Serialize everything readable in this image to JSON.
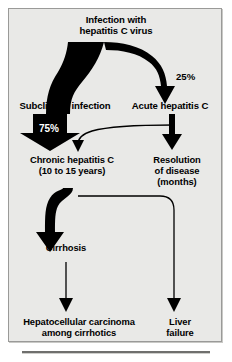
{
  "figure": {
    "background_color": "#e9e9e7",
    "border_color": "#9a9a98",
    "ink_color": "#000000"
  },
  "nodes": {
    "infection": "Infection with\nhepatitis C virus",
    "subclinical": "Subclinical infection",
    "acute": "Acute hepatitis C",
    "chronic": "Chronic hepatitis C\n(10 to 15 years)",
    "resolution": "Resolution\nof disease\n(months)",
    "cirrhosis": "Cirrhosis",
    "hcc": "Hepatocellular carcinoma\namong cirrhotics",
    "liver_failure": "Liver\nfailure"
  },
  "labels": {
    "subclinical_pct": "75%",
    "acute_pct": "25%"
  },
  "flow": [
    {
      "from": "infection",
      "to": "subclinical",
      "style": "thick-black-band",
      "label": "75%"
    },
    {
      "from": "infection",
      "to": "acute",
      "style": "thick-curved-arrow",
      "label": "25%"
    },
    {
      "from": "acute",
      "to": "resolution",
      "style": "thick-arrow",
      "label": ""
    },
    {
      "from": "acute",
      "to": "chronic",
      "style": "thin-curved-arrow",
      "label": ""
    },
    {
      "from": "subclinical",
      "to": "chronic",
      "style": "thick-block-arrow",
      "label": "75%"
    },
    {
      "from": "chronic",
      "to": "cirrhosis",
      "style": "thick-s-curve-arrow",
      "label": ""
    },
    {
      "from": "chronic",
      "to": "liver_failure",
      "style": "thin-elbow-arrow",
      "label": ""
    },
    {
      "from": "cirrhosis",
      "to": "hcc",
      "style": "thin-arrow",
      "label": ""
    }
  ]
}
